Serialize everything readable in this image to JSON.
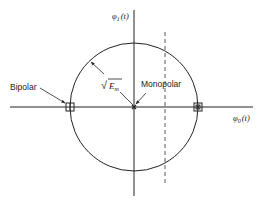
{
  "diagram": {
    "type": "signal-space constellation",
    "axes": {
      "vertical_label_symbol": "φ",
      "vertical_label_sub": "1",
      "vertical_label_arg": "(t)",
      "horizontal_label_symbol": "φ",
      "horizontal_label_sub": "0",
      "horizontal_label_arg": "(t)"
    },
    "labels": {
      "bipolar": "Bipolar",
      "monopolar": "Monopolar",
      "radius_sqrt": "√",
      "radius_symbol": "E",
      "radius_sub": "m"
    },
    "points": [
      {
        "name": "bipolar-left",
        "marker": "square",
        "x": 70,
        "y": 107
      },
      {
        "name": "monopolar-origin",
        "marker": "x",
        "x": 134,
        "y": 107
      },
      {
        "name": "right-point",
        "marker": "square+x",
        "x": 198,
        "y": 107
      }
    ],
    "circle": {
      "cx": 134,
      "cy": 107,
      "r": 64
    },
    "dashed_line": {
      "x": 165,
      "y1": 32,
      "y2": 183
    },
    "colors": {
      "line": "#222222",
      "background": "#ffffff"
    }
  }
}
